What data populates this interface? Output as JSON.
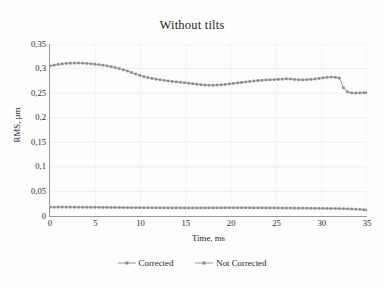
{
  "chart_data": {
    "type": "line",
    "title": "Without tilts",
    "xlabel": "Time,  ms",
    "ylabel": "RMS, µm",
    "xlim": [
      0,
      35
    ],
    "ylim": [
      0,
      0.35
    ],
    "grid": true,
    "grid_axes": "both",
    "legend_position": "bottom",
    "decimal_separator": ",",
    "ytick_labels": [
      "0,35",
      "0,3",
      "0,25",
      "0,2",
      "0,15",
      "0,1",
      "0,05",
      "0"
    ],
    "ytick_values": [
      0.35,
      0.3,
      0.25,
      0.2,
      0.15,
      0.1,
      0.05,
      0
    ],
    "xtick_labels": [
      "0",
      "5",
      "10",
      "15",
      "20",
      "25",
      "30",
      "35"
    ],
    "xtick_values": [
      0,
      5,
      10,
      15,
      20,
      25,
      30,
      35
    ],
    "marker": "square",
    "series": [
      {
        "name": "Corrected",
        "color": "#8c8c8c",
        "x": [
          0,
          0.45,
          0.9,
          1.35,
          1.8,
          2.25,
          2.7,
          3.15,
          3.6,
          4.05,
          4.5,
          4.95,
          5.4,
          5.85,
          6.3,
          6.75,
          7.2,
          7.65,
          8.1,
          8.55,
          9,
          9.45,
          9.9,
          10.35,
          10.8,
          11.25,
          11.7,
          12.15,
          12.6,
          13.05,
          13.5,
          13.95,
          14.4,
          14.85,
          15.3,
          15.75,
          16.2,
          16.65,
          17.1,
          17.55,
          18,
          18.45,
          18.9,
          19.35,
          19.8,
          20.25,
          20.7,
          21.15,
          21.6,
          22.05,
          22.5,
          22.95,
          23.4,
          23.85,
          24.3,
          24.75,
          25.2,
          25.65,
          26.1,
          26.55,
          27,
          27.45,
          27.9,
          28.35,
          28.8,
          29.25,
          29.7,
          30.15,
          30.6,
          31.05,
          31.5,
          31.95,
          32.4,
          32.85,
          33.3,
          33.75,
          34.2,
          34.65,
          35
        ],
        "y": [
          0.018,
          0.018,
          0.0182,
          0.0182,
          0.0181,
          0.018,
          0.018,
          0.0179,
          0.0178,
          0.0178,
          0.0177,
          0.0177,
          0.0176,
          0.0175,
          0.0175,
          0.0174,
          0.0173,
          0.0173,
          0.0172,
          0.0171,
          0.017,
          0.017,
          0.0169,
          0.0168,
          0.0168,
          0.0167,
          0.0167,
          0.0166,
          0.0166,
          0.0165,
          0.0165,
          0.0165,
          0.0165,
          0.0164,
          0.0164,
          0.0164,
          0.0164,
          0.0164,
          0.0165,
          0.0165,
          0.0166,
          0.0166,
          0.0167,
          0.0167,
          0.0168,
          0.0168,
          0.0168,
          0.0168,
          0.0167,
          0.0167,
          0.0166,
          0.0166,
          0.0165,
          0.0165,
          0.0164,
          0.0164,
          0.0163,
          0.0163,
          0.0162,
          0.0162,
          0.0161,
          0.016,
          0.016,
          0.0159,
          0.0158,
          0.0157,
          0.0156,
          0.0155,
          0.0154,
          0.0153,
          0.0152,
          0.0151,
          0.0149,
          0.0146,
          0.0142,
          0.0138,
          0.0133,
          0.0128,
          0.0122
        ]
      },
      {
        "name": "Not Corrected",
        "color": "#8c8c8c",
        "x": [
          0,
          0.45,
          0.9,
          1.35,
          1.8,
          2.25,
          2.7,
          3.15,
          3.6,
          4.05,
          4.5,
          4.95,
          5.4,
          5.85,
          6.3,
          6.75,
          7.2,
          7.65,
          8.1,
          8.55,
          9,
          9.45,
          9.9,
          10.35,
          10.8,
          11.25,
          11.7,
          12.15,
          12.6,
          13.05,
          13.5,
          13.95,
          14.4,
          14.85,
          15.3,
          15.75,
          16.2,
          16.65,
          17.1,
          17.55,
          18,
          18.45,
          18.9,
          19.35,
          19.8,
          20.25,
          20.7,
          21.15,
          21.6,
          22.05,
          22.5,
          22.95,
          23.4,
          23.85,
          24.3,
          24.75,
          25.2,
          25.65,
          26.1,
          26.55,
          27,
          27.45,
          27.9,
          28.35,
          28.8,
          29.25,
          29.7,
          30.15,
          30.6,
          31.05,
          31.5,
          31.95,
          32.4,
          32.85,
          33.3,
          33.75,
          34.2,
          34.65,
          35
        ],
        "y": [
          0.3055,
          0.307,
          0.3085,
          0.3095,
          0.3105,
          0.311,
          0.3112,
          0.3112,
          0.311,
          0.3105,
          0.3098,
          0.309,
          0.308,
          0.3068,
          0.3055,
          0.304,
          0.3022,
          0.3,
          0.2975,
          0.295,
          0.292,
          0.289,
          0.2862,
          0.2838,
          0.2818,
          0.28,
          0.2785,
          0.2772,
          0.276,
          0.2748,
          0.2738,
          0.273,
          0.2722,
          0.2712,
          0.2702,
          0.2692,
          0.2682,
          0.2672,
          0.2665,
          0.2662,
          0.2662,
          0.2665,
          0.267,
          0.2678,
          0.2688,
          0.2698,
          0.2708,
          0.2718,
          0.2728,
          0.2738,
          0.2748,
          0.2756,
          0.2762,
          0.2768,
          0.2772,
          0.2776,
          0.278,
          0.2785,
          0.2792,
          0.2788,
          0.2778,
          0.2772,
          0.2772,
          0.2775,
          0.278,
          0.2788,
          0.2798,
          0.2812,
          0.2822,
          0.2828,
          0.2822,
          0.2808,
          0.2608,
          0.2525,
          0.2505,
          0.2502,
          0.2505,
          0.2508,
          0.251
        ]
      }
    ]
  },
  "legend": {
    "items": [
      {
        "label": "Corrected"
      },
      {
        "label": "Not Corrected"
      }
    ]
  }
}
